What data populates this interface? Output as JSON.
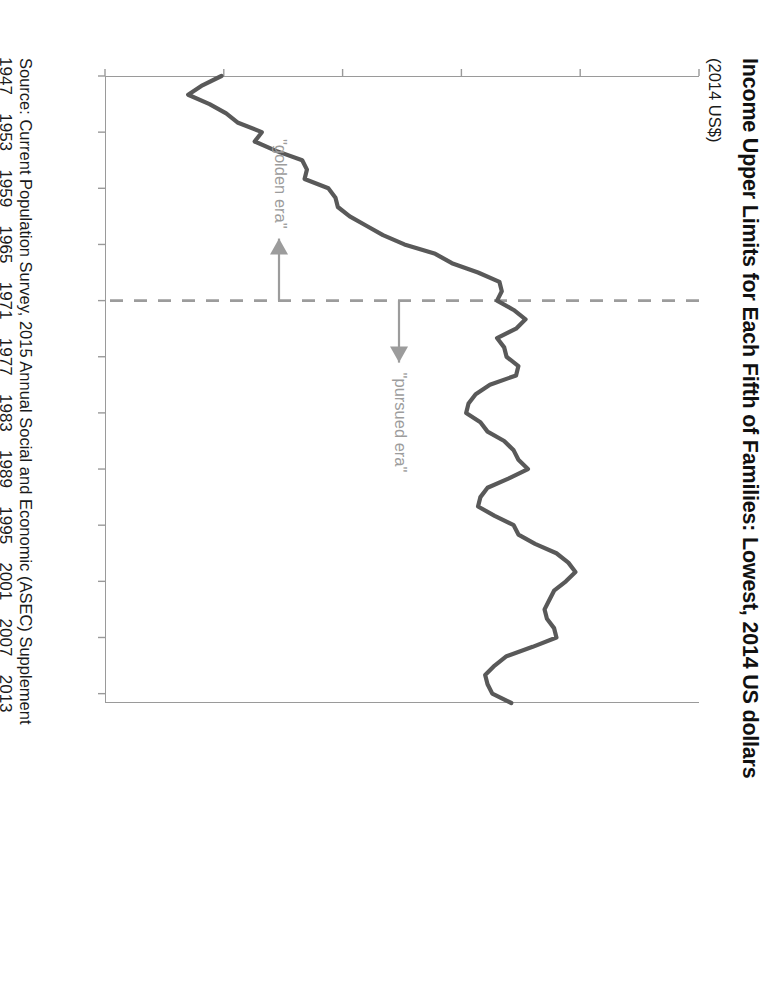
{
  "figure": {
    "title": "Income Upper Limits for Each Fifth of Families: Lowest, 2014 US dollars",
    "subtitle": "(2014 US$)",
    "source": "Source: Current Population Survey, 2015 Annual Social and Economic (ASEC) Supplement"
  },
  "annotations": {
    "golden_era_label": "\"golden era\"",
    "pursued_era_label": "\"pursued era\"",
    "divider_year": 1971,
    "divider_color": "#9c9c9c"
  },
  "colors": {
    "line": "#595959",
    "axis": "#9a9a9a",
    "annotation": "#9c9c9c",
    "text": "#1a1a1a",
    "background": "#ffffff"
  },
  "chart_data": {
    "type": "line",
    "title": "Income Upper Limits for Each Fifth of Families: Lowest, 2014 US dollars",
    "xlabel": "",
    "ylabel": "(2014 US$)",
    "xlim": [
      1947,
      2014
    ],
    "ylim": [
      10000,
      35000
    ],
    "ytick_values": [
      10000,
      15000,
      20000,
      25000,
      30000,
      35000
    ],
    "ytick_labels": [
      "10000",
      "15000",
      "20000",
      "25000",
      "30000",
      "35000"
    ],
    "xtick_values": [
      1947,
      1953,
      1959,
      1965,
      1971,
      1977,
      1983,
      1989,
      1995,
      2001,
      2007,
      2013
    ],
    "xtick_labels": [
      "1947",
      "1953",
      "1959",
      "1965",
      "1971",
      "1977",
      "1983",
      "1989",
      "1995",
      "2001",
      "2007",
      "2013"
    ],
    "grid": false,
    "legend": false,
    "series": [
      {
        "name": "Lowest fifth upper limit",
        "x": [
          1947,
          1948,
          1949,
          1950,
          1951,
          1952,
          1953,
          1954,
          1955,
          1956,
          1957,
          1958,
          1959,
          1960,
          1961,
          1962,
          1963,
          1964,
          1965,
          1966,
          1967,
          1968,
          1969,
          1970,
          1971,
          1972,
          1973,
          1974,
          1975,
          1976,
          1977,
          1978,
          1979,
          1980,
          1981,
          1982,
          1983,
          1984,
          1985,
          1986,
          1987,
          1988,
          1989,
          1990,
          1991,
          1992,
          1993,
          1994,
          1995,
          1996,
          1997,
          1998,
          1999,
          2000,
          2001,
          2002,
          2003,
          2004,
          2005,
          2006,
          2007,
          2008,
          2009,
          2010,
          2011,
          2012,
          2013,
          2014
        ],
        "values": [
          14900,
          14100,
          13500,
          14400,
          15100,
          15600,
          16600,
          16300,
          17200,
          18300,
          18500,
          18400,
          19400,
          19700,
          19800,
          20300,
          21000,
          21700,
          22600,
          23900,
          24600,
          25700,
          26600,
          26700,
          26500,
          27200,
          27700,
          27300,
          26500,
          26800,
          26900,
          27400,
          27300,
          26200,
          25600,
          25300,
          25200,
          25800,
          26100,
          26800,
          27200,
          27400,
          27800,
          27000,
          26100,
          25800,
          25700,
          26400,
          27200,
          27400,
          28100,
          29000,
          29500,
          29800,
          29400,
          28900,
          28700,
          28500,
          28600,
          28900,
          29000,
          28000,
          26900,
          26400,
          26000,
          26100,
          26300,
          27100
        ]
      }
    ]
  }
}
